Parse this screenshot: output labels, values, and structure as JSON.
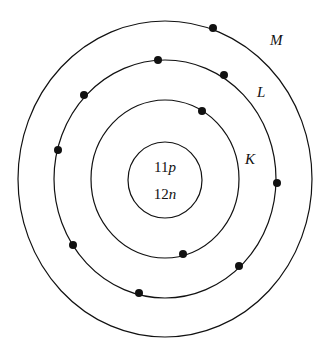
{
  "diagram": {
    "type": "bohr-atom-model",
    "nucleus": {
      "protons_label": "11",
      "protons_unit": "p",
      "neutrons_label": "12",
      "neutrons_unit": "n"
    },
    "shells": [
      {
        "label": "K",
        "electrons": 2
      },
      {
        "label": "L",
        "electrons": 8
      },
      {
        "label": "M",
        "electrons": 1
      }
    ]
  }
}
